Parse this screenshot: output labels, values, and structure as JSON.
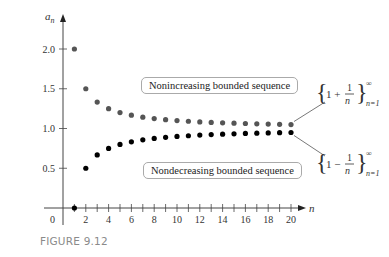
{
  "chart_data": {
    "type": "scatter",
    "title": "",
    "xlabel": "n",
    "ylabel": "a_n",
    "xlim": [
      0,
      21
    ],
    "ylim": [
      0,
      2.2
    ],
    "x_ticks": [
      2,
      4,
      6,
      8,
      10,
      12,
      14,
      16,
      18,
      20
    ],
    "y_ticks": [
      0.5,
      1.0,
      1.5,
      2.0
    ],
    "origin_label": "0",
    "grid": false,
    "series": [
      {
        "name": "{1 + 1/n}, n=1 to ∞",
        "color": "#555555",
        "x": [
          1,
          2,
          3,
          4,
          5,
          6,
          7,
          8,
          9,
          10,
          11,
          12,
          13,
          14,
          15,
          16,
          17,
          18,
          19,
          20
        ],
        "values": [
          2.0,
          1.5,
          1.333,
          1.25,
          1.2,
          1.167,
          1.143,
          1.125,
          1.111,
          1.1,
          1.091,
          1.083,
          1.077,
          1.071,
          1.067,
          1.063,
          1.059,
          1.056,
          1.053,
          1.05
        ]
      },
      {
        "name": "{1 − 1/n}, n=1 to ∞",
        "color": "#000000",
        "x": [
          1,
          2,
          3,
          4,
          5,
          6,
          7,
          8,
          9,
          10,
          11,
          12,
          13,
          14,
          15,
          16,
          17,
          18,
          19,
          20
        ],
        "values": [
          0.0,
          0.5,
          0.667,
          0.75,
          0.8,
          0.833,
          0.857,
          0.875,
          0.889,
          0.9,
          0.909,
          0.917,
          0.923,
          0.929,
          0.933,
          0.938,
          0.941,
          0.944,
          0.947,
          0.95
        ]
      }
    ],
    "annotations": [
      "Nonincreasing bounded sequence",
      "Nondecreasing bounded sequence"
    ]
  },
  "labels": {
    "y_axis": "a",
    "y_axis_sub": "n",
    "x_axis": "n",
    "origin": "0",
    "upper_box": "Nonincreasing bounded sequence",
    "lower_box": "Nondecreasing bounded sequence",
    "upper_formula": "{1 + 1/n}",
    "upper_formula_sup": "∞",
    "upper_formula_sub": "n=1",
    "lower_formula": "{1 − 1/n}",
    "lower_formula_sup": "∞",
    "lower_formula_sub": "n=1",
    "caption": "FIGURE 9.12"
  }
}
